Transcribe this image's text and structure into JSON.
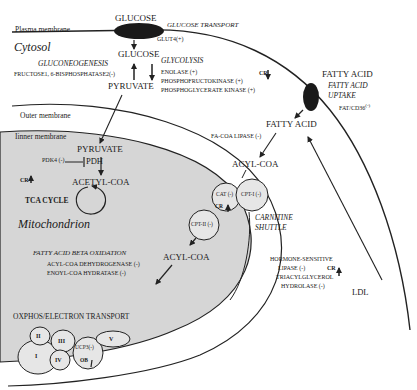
{
  "regions": {
    "plasma_membrane": "Plasma membrane",
    "cytosol": "Cytosol",
    "outer_membrane": "Outer membrane",
    "inner_membrane": "Iinner membrane",
    "mitochondrion": "Mitochondrion"
  },
  "glucose": {
    "external": "GLUCOSE",
    "transport_title": "GLUCOSE TRANSPORT",
    "transporter": "GLUT4(+)",
    "internal": "GLUCOSE",
    "pyruvate": "PYRUVATE"
  },
  "gluconeogenesis": {
    "title": "GLUCONEOGENESIS",
    "enzyme": "FRUCTOSE1, 6-BISPHOSPHATASE2(-)"
  },
  "glycolysis": {
    "title": "GLYCOLYSIS",
    "enzymes": [
      "ENOLASE (+)",
      "PHOSPHOFRUCTOKINASE (+)",
      "PHOSPHOGLYCERATE KINASE (+)"
    ]
  },
  "cr_markers": {
    "glycolysis": "CR",
    "pdh": "CR",
    "cat": "CR",
    "lipase": "CR",
    "ob": "OB"
  },
  "fatty_acid_uptake": {
    "external": "FATTY ACID",
    "title_line1": "FATTY ACID",
    "title_line2": "UPTAKE",
    "transporter": "FAT/CD36",
    "transporter_sign": "(-)",
    "internal": "FATTY ACID",
    "lipase": "FA-COA LIPASE (-)",
    "acyl_coa": "ACYL-COA"
  },
  "pdh": {
    "pyruvate": "PYRUVATE",
    "inhibitor": "PDK4 (-)",
    "enzyme": "PDH",
    "acetyl_coa": "ACETYL-COA"
  },
  "tca": {
    "title": "TCA CYCLE"
  },
  "carnitine_shuttle": {
    "cat": "CAT (-)",
    "cpt1": "CPT-I (-)",
    "cpt2": "CPT-II (-)",
    "title_line1": "CARNITINE",
    "title_line2": "SHUTTLE"
  },
  "beta_oxidation": {
    "title": "FATTY ACID BETA OXIDATION",
    "enzymes": [
      "ACYL-COA DEHYDROGENASE (-)",
      "ENOYL-COA HYDRATASE (-)"
    ],
    "acyl_coa": "ACYL-COA"
  },
  "lipolysis": {
    "line1": "HORMONE-SENSITIVE",
    "line2": "LIPASE (-)",
    "line3": "TRIACYLGLYCEROL",
    "line4": "HYDROLASE (-)",
    "source": "LDL"
  },
  "oxphos": {
    "title": "OXPHOS/ELECTRON TRANSPORT",
    "complexes": [
      "I",
      "II",
      "III",
      "IV",
      "V"
    ],
    "ucp3": "UCP3(-)"
  },
  "colors": {
    "matrix": "#d6d6d6",
    "complex_fill": "#e6e6e6",
    "line": "#222222",
    "transporter": "#1a1a1a"
  }
}
